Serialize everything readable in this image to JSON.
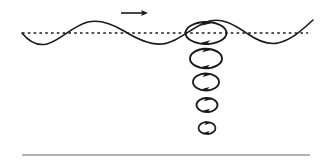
{
  "figure": {
    "type": "physics-diagram",
    "background_color": "#ffffff",
    "ink_color": "#1a1a1a",
    "seabed_color": "#9a9a9a",
    "width": 324,
    "height": 160
  },
  "surface_wave": {
    "name": "wave-profile",
    "label": "",
    "stroke_color": "#1a1a1a",
    "stroke_width": 1.6,
    "amplitude": 11,
    "wavelength": 112,
    "baseline_y": 33,
    "x_start": 22,
    "x_end": 313,
    "path": "M 22,33 C 30,43 38,46 47,44 C 60,41 72,26 88,22 C 101,19 114,25 124,31 C 137,39 150,45 162,44 C 176,43 190,29 206,22 C 222,16 236,26 248,34 C 258,41 268,45 278,43 C 292,40 303,29 313,20"
  },
  "mean_level_line": {
    "name": "mean-water-level",
    "label": "",
    "y": 33,
    "x_start": 22,
    "x_end": 308,
    "stroke_color": "#1a1a1a",
    "stroke_width": 1.5,
    "dash_pattern": "2.6 3.2"
  },
  "propagation_arrow": {
    "name": "wave-direction-arrow",
    "label": "",
    "direction": "right",
    "x_start": 121,
    "x_end": 148,
    "y": 13,
    "stroke_color": "#1a1a1a",
    "stroke_width": 1.6,
    "head_length": 7,
    "head_width": 5
  },
  "orbit_column": {
    "name": "orbital-motion-column",
    "center_x": 206,
    "rotation_sense": "clockwise",
    "description": "Circular orbits of water particles shrinking with depth",
    "orbits": [
      {
        "id": "orbit-1",
        "depth_index": 1,
        "cx": 206,
        "cy": 33,
        "rx": 20.5,
        "ry": 11,
        "stroke_width": 1.9,
        "arrow_size": 4.4
      },
      {
        "id": "orbit-2",
        "depth_index": 2,
        "cx": 206,
        "cy": 58.5,
        "rx": 16,
        "ry": 9.8,
        "stroke_width": 1.9,
        "arrow_size": 4.2
      },
      {
        "id": "orbit-3",
        "depth_index": 3,
        "cx": 206,
        "cy": 82,
        "rx": 13,
        "ry": 8.5,
        "stroke_width": 1.8,
        "arrow_size": 4.0
      },
      {
        "id": "orbit-4",
        "depth_index": 4,
        "cx": 207,
        "cy": 105,
        "rx": 10.5,
        "ry": 7,
        "stroke_width": 1.8,
        "arrow_size": 3.8
      },
      {
        "id": "orbit-5",
        "depth_index": 5,
        "cx": 207,
        "cy": 128,
        "rx": 8.5,
        "ry": 6,
        "stroke_width": 1.7,
        "arrow_size": 3.6
      }
    ]
  },
  "seabed_line": {
    "name": "seabed",
    "label": "",
    "y": 155,
    "x_start": 22,
    "x_end": 310,
    "stroke_color": "#9a9a9a",
    "stroke_width": 1.4
  }
}
